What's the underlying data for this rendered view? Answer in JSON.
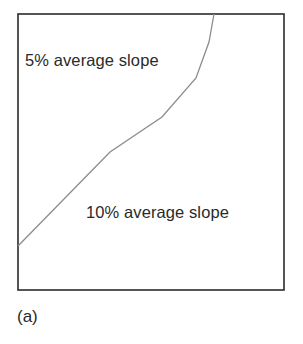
{
  "figure": {
    "caption": "(a)",
    "regions": [
      {
        "label": "5% average slope",
        "position": "upper-left"
      },
      {
        "label": "10% average slope",
        "position": "lower-right"
      }
    ],
    "frame": {
      "x": 18,
      "y": 14,
      "width": 266,
      "height": 276,
      "stroke": "#2b2b2b"
    },
    "boundary_line": {
      "stroke": "#8c8c8c",
      "points": [
        [
          18,
          246
        ],
        [
          110,
          152
        ],
        [
          162,
          117
        ],
        [
          196,
          78
        ],
        [
          209,
          42
        ],
        [
          214,
          14
        ]
      ]
    }
  }
}
